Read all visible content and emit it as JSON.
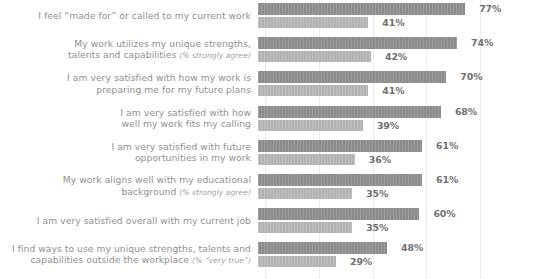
{
  "chart_data": {
    "type": "bar",
    "orientation": "horizontal",
    "title": "",
    "subtitle": "",
    "xlabel": "",
    "ylabel": "",
    "xlim": [
      0,
      100
    ],
    "grid": true,
    "gridlines_at": [
      0,
      20,
      40,
      60,
      80
    ],
    "legend": "none",
    "legend_position": "none",
    "colors": {
      "series_primary": "#8b8b8b",
      "series_secondary": "#b2b2b2",
      "label_text": "#909090",
      "value_text": "#6f6f6f",
      "gridline": "#ececec",
      "background": "#ffffff"
    },
    "categories": [
      "I feel “made for” or called to my current work",
      "My work utilizes my unique strengths,\ntalents and capabilities",
      "I am very satisfied with how my work is\npreparing me for my future plans",
      "I am very satisfied with how\nwell my work fits my calling",
      "I am very satisfied with future\nopportunities in my work",
      "My work aligns well with my educational\nbackground",
      "I am very satisfied overall with my current job",
      "I find ways to use my unique strengths, talents and\ncapabilities outside the workplace"
    ],
    "category_qualifiers": [
      "",
      "(% strongly agree)",
      "",
      "",
      "",
      "(% strongly agree)",
      "",
      "(% “very true”)"
    ],
    "series": [
      {
        "name": "primary",
        "values": [
          77,
          74,
          70,
          68,
          61,
          61,
          60,
          48
        ],
        "labels": [
          "77%",
          "74%",
          "70%",
          "68%",
          "61%",
          "61%",
          "60%",
          "48%"
        ]
      },
      {
        "name": "secondary",
        "values": [
          41,
          42,
          41,
          39,
          36,
          35,
          35,
          29
        ],
        "labels": [
          "41%",
          "42%",
          "41%",
          "39%",
          "36%",
          "35%",
          "35%",
          "29%"
        ]
      }
    ]
  }
}
